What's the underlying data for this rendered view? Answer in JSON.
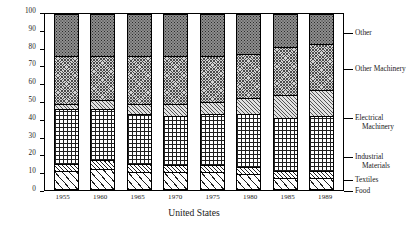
{
  "chart_data": {
    "type": "bar",
    "title": "",
    "subtitle": "",
    "xlabel": "United States",
    "ylabel": "",
    "ylim": [
      0,
      100
    ],
    "yticks": [
      0,
      10,
      20,
      30,
      40,
      50,
      60,
      70,
      80,
      90,
      100
    ],
    "grid": false,
    "stacked": true,
    "normalized_percent": true,
    "legend_position": "right",
    "categories": [
      "1955",
      "1960",
      "1965",
      "1970",
      "1975",
      "1980",
      "1985",
      "1989"
    ],
    "series": [
      {
        "name": "Food",
        "pattern": "wide-diagonal-hatch",
        "values": [
          11,
          12,
          10,
          10,
          10,
          9,
          7,
          7
        ]
      },
      {
        "name": "Textiles",
        "pattern": "thin-diagonal-hatch",
        "values": [
          4,
          5,
          5,
          4,
          4,
          4,
          4,
          4
        ]
      },
      {
        "name": "Industrial Materials",
        "pattern": "large-checkerboard",
        "values": [
          31,
          29,
          28,
          28,
          29,
          30,
          30,
          31
        ]
      },
      {
        "name": "Electrical Machinery",
        "pattern": "light-diagonal-hatch",
        "values": [
          3,
          5,
          6,
          7,
          7,
          9,
          13,
          15
        ]
      },
      {
        "name": "Other Machinery",
        "pattern": "fine-crosshatch",
        "values": [
          27,
          25,
          27,
          27,
          26,
          25,
          27,
          26
        ]
      },
      {
        "name": "Other",
        "pattern": "dark-dots",
        "values": [
          24,
          24,
          24,
          24,
          24,
          23,
          19,
          17
        ]
      }
    ],
    "legend_entries": [
      {
        "label": "Other",
        "line1": "Other",
        "line2": ""
      },
      {
        "label": "Other Machinery",
        "line1": "Other Machinery",
        "line2": ""
      },
      {
        "label": "Electrical Machinery",
        "line1": "Electrical",
        "line2": "Machinery"
      },
      {
        "label": "Industrial Materials",
        "line1": "Industrial",
        "line2": "Materials"
      },
      {
        "label": "Textiles",
        "line1": "Textiles",
        "line2": ""
      },
      {
        "label": "Food",
        "line1": "Food",
        "line2": ""
      }
    ],
    "colors": {
      "axis": "#000000",
      "other": "#8f8f8f",
      "other_machinery": "#d2d2d2",
      "electrical_machinery": "#e2e2e2",
      "industrial_materials": "#ffffff",
      "textiles": "#ffffff",
      "food": "#ffffff"
    }
  }
}
